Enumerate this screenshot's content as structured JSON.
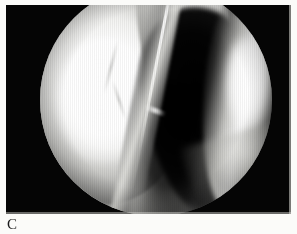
{
  "figure": {
    "label": "C",
    "caption": "",
    "kind": "arthroscopic-photograph",
    "modality": "knee arthroscopy video still",
    "plate": {
      "background_color": "#050505",
      "paper_color": "#fbfbf9",
      "border_color": "#d8d8d4"
    },
    "scope_view": {
      "shape": "circle",
      "center_x": 156,
      "center_y": 100,
      "radius": 116,
      "vignette": true,
      "scanlines": true
    },
    "regions": [
      {
        "name": "left-condyle",
        "description": "large glossy bright articular surface occupying the left half of the field",
        "tone": "#ffffff",
        "brightness": "specular-white"
      },
      {
        "name": "synovial-fold-ridge",
        "description": "pale ridge running from upper-left toward lower-centre with a thin bright seam",
        "tone": "#e0e0dc",
        "brightness": "light-grey"
      },
      {
        "name": "central-notch-wedge",
        "description": "mid-grey soft tissue wedge at the top centre forming a V-shaped notch",
        "tone": "#b9b9b6",
        "brightness": "mid-grey"
      },
      {
        "name": "ligament-band",
        "description": "bright band of ligamentous tissue to the right of the notch",
        "tone": "#fafaf8",
        "brightness": "bright"
      },
      {
        "name": "dark-recess",
        "description": "deep black triangular intercondylar recess filling the centre and lower-right",
        "tone": "#000000",
        "brightness": "black"
      },
      {
        "name": "right-band",
        "description": "bright vertical surface along the right margin of the scope view",
        "tone": "#ffffff",
        "brightness": "specular-white"
      },
      {
        "name": "bottom-crescent",
        "description": "faint bright crescent along the lower-right rim of the scope view",
        "tone": "#e6e6e2",
        "brightness": "light-grey"
      }
    ]
  }
}
